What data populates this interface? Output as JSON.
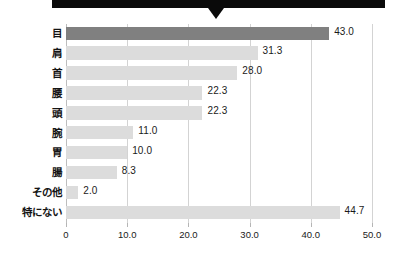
{
  "banner": {
    "label": "",
    "color": "#0a0a0a",
    "pointer_name": "down-triangle-marker"
  },
  "chart_data": {
    "type": "bar",
    "orientation": "horizontal",
    "title": "",
    "xlabel": "",
    "ylabel": "",
    "xlim": [
      0,
      50
    ],
    "grid": true,
    "legend": false,
    "categories": [
      "目",
      "肩",
      "首",
      "腰",
      "頭",
      "腕",
      "胃",
      "腸",
      "その他",
      "特にない"
    ],
    "values": [
      43.0,
      31.3,
      28.0,
      22.3,
      22.3,
      11.0,
      10.0,
      8.3,
      2.0,
      44.7
    ],
    "value_labels": [
      "43.0",
      "31.3",
      "28.0",
      "22.3",
      "22.3",
      "11.0",
      "10.0",
      "8.3",
      "2.0",
      "44.7"
    ],
    "highlight_index": 0,
    "bar_color": "#dcdcdc",
    "highlight_color": "#808080",
    "tick_values": [
      0,
      10,
      20,
      30,
      40,
      50
    ],
    "tick_labels": [
      "0",
      "10.0",
      "20.0",
      "30.0",
      "40.0",
      "50.0"
    ]
  }
}
